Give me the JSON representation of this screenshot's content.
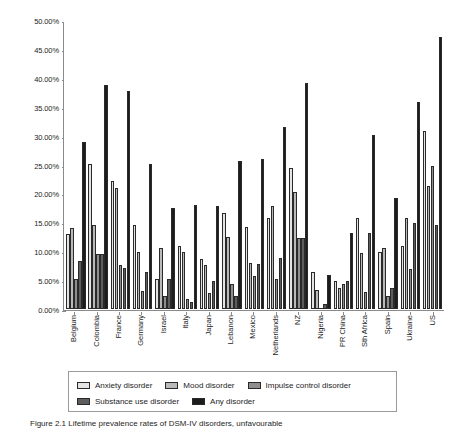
{
  "figure": {
    "caption": "Figure 2.1 Lifetime prevalence rates of DSM-IV disorders, unfavourable",
    "series_colors": [
      "#e4e4e4",
      "#b9b9b9",
      "#8e8e8e",
      "#5d5d5d",
      "#1c1c1c"
    ]
  },
  "legend": {
    "items": [
      {
        "label": "Anxiety disorder",
        "color": "#e4e4e4"
      },
      {
        "label": "Mood disorder",
        "color": "#b9b9b9"
      },
      {
        "label": "Impulse control disorder",
        "color": "#8e8e8e"
      },
      {
        "label": "Substance use disorder",
        "color": "#5d5d5d"
      },
      {
        "label": "Any disorder",
        "color": "#1c1c1c"
      }
    ]
  },
  "chart_data": {
    "type": "bar",
    "title": "",
    "xlabel": "",
    "ylabel": "",
    "ylim": [
      0,
      50
    ],
    "yticks": [
      "0.00%",
      "5.00%",
      "10.00%",
      "15.00%",
      "20.00%",
      "25.00%",
      "30.00%",
      "35.00%",
      "40.00%",
      "45.00%",
      "50.00%"
    ],
    "ytick_values": [
      0,
      5,
      10,
      15,
      20,
      25,
      30,
      35,
      40,
      45,
      50
    ],
    "grid": false,
    "legend_position": "bottom",
    "categories": [
      "Belgium",
      "Colombia",
      "France",
      "Germany",
      "Israel",
      "Italy",
      "Japan",
      "Lebanon",
      "Mexico",
      "Netherlands",
      "NZ",
      "Nigeria",
      "PR China",
      "Sth Africa",
      "Spain",
      "Ukraine",
      "US"
    ],
    "series": [
      {
        "name": "Anxiety disorder",
        "values": [
          13.1,
          25.3,
          22.3,
          14.6,
          5.2,
          11.0,
          8.8,
          16.7,
          14.3,
          15.9,
          24.6,
          6.5,
          4.8,
          15.8,
          9.9,
          10.9,
          31.0
        ]
      },
      {
        "name": "Mood disorder",
        "values": [
          14.1,
          14.6,
          21.0,
          9.9,
          10.7,
          9.9,
          7.6,
          12.6,
          8.0,
          17.9,
          20.4,
          3.3,
          3.6,
          9.8,
          10.6,
          15.8,
          21.4
        ]
      },
      {
        "name": "Impulse control disorder",
        "values": [
          5.2,
          9.6,
          7.6,
          3.1,
          2.3,
          1.7,
          2.8,
          4.4,
          5.7,
          5.2,
          12.4,
          0.0,
          4.3,
          3.0,
          2.3,
          6.9,
          25.0
        ]
      },
      {
        "name": "Substance use disorder",
        "values": [
          8.3,
          9.6,
          7.1,
          6.5,
          5.3,
          1.3,
          4.8,
          2.2,
          7.8,
          8.9,
          12.4,
          0.8,
          4.9,
          13.3,
          3.6,
          15.0,
          14.6
        ]
      },
      {
        "name": "Any disorder",
        "values": [
          29.1,
          39.1,
          37.9,
          25.2,
          17.6,
          18.1,
          18.0,
          25.8,
          26.1,
          31.7,
          39.3,
          6.0,
          13.2,
          30.3,
          19.4,
          36.1,
          47.4
        ]
      }
    ]
  }
}
